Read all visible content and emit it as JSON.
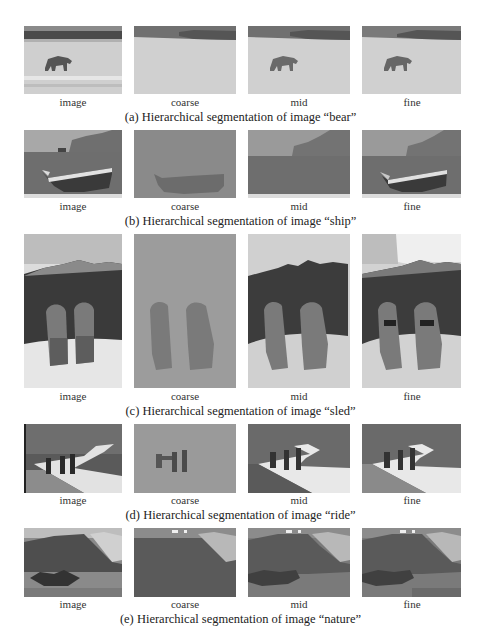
{
  "header": {
    "text": ""
  },
  "column_labels": [
    "image",
    "coarse",
    "mid",
    "fine"
  ],
  "rows": [
    {
      "id": "bear",
      "caption": "(a) Hierarchical segmentation of image “bear”",
      "labels": [
        "image",
        "coarse",
        "mid",
        "fine"
      ]
    },
    {
      "id": "ship",
      "caption": "(b) Hierarchical segmentation of image “ship”",
      "labels": [
        "image",
        "coarse",
        "mid",
        "fine"
      ]
    },
    {
      "id": "sled",
      "caption": "(c) Hierarchical segmentation of image “sled”",
      "labels": [
        "image",
        "coarse",
        "mid",
        "fine"
      ]
    },
    {
      "id": "ride",
      "caption": "(d) Hierarchical segmentation of image “ride”",
      "labels": [
        "image",
        "coarse",
        "mid",
        "fine"
      ]
    },
    {
      "id": "nature",
      "caption": "(e) Hierarchical segmentation of image “nature”",
      "labels": [
        "image",
        "coarse",
        "mid",
        "fine"
      ]
    }
  ],
  "colors": {
    "page_bg": "#ffffff",
    "seg_light": "#d2d2d2",
    "seg_mid": "#a6a6a6",
    "seg_dark": "#5a5a5a",
    "seg_darker": "#3c3c3c"
  }
}
